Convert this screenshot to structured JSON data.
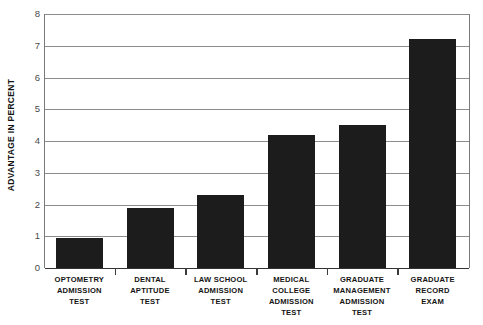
{
  "chart_data": {
    "type": "bar",
    "title": "",
    "xlabel": "",
    "ylabel": "ADVANTAGE IN PERCENT",
    "ylim": [
      0,
      8
    ],
    "ytick_step": 1,
    "yticks": [
      "8",
      "7",
      "6",
      "5",
      "4",
      "3",
      "2",
      "1",
      "0"
    ],
    "grid": true,
    "legend": false,
    "bar_color": "#1c1c1c",
    "categories": [
      "OPTOMETRY ADMISSION TEST",
      "DENTAL APTITUDE TEST",
      "LAW SCHOOL ADMISSION TEST",
      "MEDICAL COLLEGE ADMISSION TEST",
      "GRADUATE MANAGEMENT ADMISSION TEST",
      "GRADUATE RECORD EXAM"
    ],
    "category_lines": [
      [
        "OPTOMETRY",
        "ADMISSION",
        "TEST"
      ],
      [
        "DENTAL",
        "APTITUDE",
        "TEST"
      ],
      [
        "LAW SCHOOL",
        "ADMISSION",
        "TEST"
      ],
      [
        "MEDICAL",
        "COLLEGE",
        "ADMISSION",
        "TEST"
      ],
      [
        "GRADUATE",
        "MANAGEMENT",
        "ADMISSION",
        "TEST"
      ],
      [
        "GRADUATE",
        "RECORD",
        "EXAM"
      ]
    ],
    "values": [
      0.95,
      1.9,
      2.3,
      4.2,
      4.5,
      7.2
    ]
  }
}
